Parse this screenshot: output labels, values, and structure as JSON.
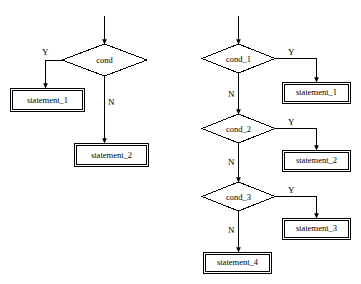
{
  "diagram": {
    "background_color": "#ffffff",
    "stroke_color": "#000000",
    "left_chart": {
      "decisions": [
        {
          "id": "cond",
          "label": "cond"
        }
      ],
      "statements": [
        {
          "id": "stmt1",
          "label": "statement_1"
        },
        {
          "id": "stmt2",
          "label": "statement_2"
        }
      ],
      "edge_labels": [
        {
          "id": "yes",
          "label": "Y"
        },
        {
          "id": "no",
          "label": "N"
        }
      ]
    },
    "right_chart": {
      "decisions": [
        {
          "id": "cond_1",
          "label": "cond_1"
        },
        {
          "id": "cond_2",
          "label": "cond_2"
        },
        {
          "id": "cond_3",
          "label": "cond_3"
        }
      ],
      "statements": [
        {
          "id": "stmt1",
          "label": "statement_1"
        },
        {
          "id": "stmt2",
          "label": "statement_2"
        },
        {
          "id": "stmt3",
          "label": "statement_3"
        },
        {
          "id": "stmt4",
          "label": "statement_4"
        }
      ],
      "edge_labels": [
        {
          "id": "yes1",
          "label": "Y"
        },
        {
          "id": "no1",
          "label": "N"
        },
        {
          "id": "yes2",
          "label": "Y"
        },
        {
          "id": "no2",
          "label": "N"
        },
        {
          "id": "yes3",
          "label": "Y"
        },
        {
          "id": "no3",
          "label": "N"
        }
      ]
    }
  }
}
